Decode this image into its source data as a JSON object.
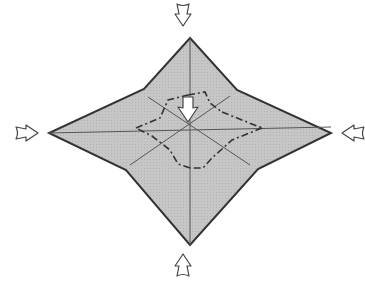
{
  "diagram": {
    "type": "origami-fold-step",
    "colors": {
      "fill": "#c4c4c4",
      "outline": "#333333",
      "crease": "#555555",
      "arrow_stroke": "#444444",
      "arrow_fill": "#ffffff",
      "background": "#ffffff"
    },
    "shape": {
      "outer_points": [
        [
          190,
          38
        ],
        [
          237,
          90
        ],
        [
          331,
          133
        ],
        [
          258,
          169
        ],
        [
          190,
          245
        ],
        [
          126,
          170
        ],
        [
          49,
          133
        ],
        [
          144,
          89
        ]
      ],
      "center": [
        188,
        120
      ]
    },
    "crease_lines": [
      {
        "from": [
          190,
          38
        ],
        "to": [
          190,
          245
        ],
        "style": "valley"
      },
      {
        "from": [
          49,
          133
        ],
        "to": [
          331,
          133
        ],
        "style": "valley"
      },
      {
        "from": [
          144,
          89
        ],
        "to": [
          258,
          169
        ],
        "style": "valley"
      },
      {
        "from": [
          237,
          90
        ],
        "to": [
          126,
          170
        ],
        "style": "valley"
      }
    ],
    "mountain_fold": {
      "points": [
        [
          188,
          95
        ],
        [
          212,
          95
        ],
        [
          222,
          115
        ],
        [
          262,
          128
        ],
        [
          232,
          142
        ],
        [
          208,
          165
        ],
        [
          190,
          168
        ],
        [
          172,
          162
        ],
        [
          148,
          140
        ],
        [
          135,
          128
        ],
        [
          162,
          116
        ],
        [
          170,
          97
        ]
      ],
      "style": "dash-dot"
    },
    "arrows": [
      {
        "name": "push-arrow-top",
        "x": 183,
        "y": 10,
        "direction": "down"
      },
      {
        "name": "push-arrow-bottom",
        "x": 183,
        "y": 262,
        "direction": "up"
      },
      {
        "name": "push-arrow-left",
        "x": 24,
        "y": 133,
        "direction": "right"
      },
      {
        "name": "push-arrow-right",
        "x": 357,
        "y": 133,
        "direction": "left"
      },
      {
        "name": "sink-arrow-center",
        "x": 188,
        "y": 105,
        "direction": "down"
      }
    ]
  }
}
